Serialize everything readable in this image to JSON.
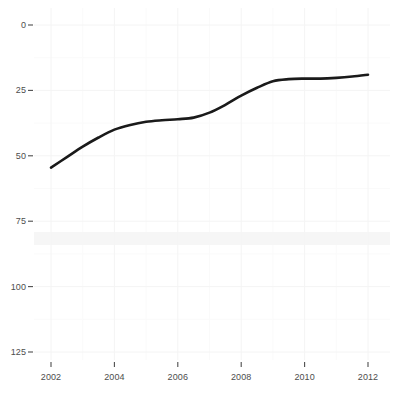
{
  "chart_data": {
    "type": "line",
    "title": "",
    "subtitle": "",
    "xlabel": "",
    "ylabel": "",
    "xlim": [
      2002,
      2012
    ],
    "ylim": [
      0,
      125
    ],
    "grid": true,
    "legend": null,
    "line_color": "#1a1a1a",
    "background_color": "#ffffff",
    "grid_color": "#f2f2f2",
    "x_ticks": [
      "2002",
      "2004",
      "2006",
      "2008",
      "2010",
      "2012"
    ],
    "x_tick_values": [
      2002,
      2004,
      2006,
      2008,
      2010,
      2012
    ],
    "y_ticks": [
      "0",
      "25",
      "50",
      "75",
      "100",
      "125"
    ],
    "y_tick_values": [
      0,
      25,
      50,
      75,
      100,
      125
    ],
    "x": [
      2002,
      2002.5,
      2003,
      2003.5,
      2004,
      2004.5,
      2005,
      2005.5,
      2006,
      2006.5,
      2007,
      2007.5,
      2008,
      2008.5,
      2009,
      2009.5,
      2010,
      2010.5,
      2011,
      2011.5,
      2012
    ],
    "values": [
      70.5,
      74.5,
      78.5,
      82.0,
      85.0,
      86.8,
      88.0,
      88.6,
      89.0,
      89.6,
      91.5,
      94.5,
      98.0,
      101.0,
      103.5,
      104.3,
      104.5,
      104.5,
      104.8,
      105.3,
      106.0
    ],
    "series": [
      {
        "name": "series-1",
        "x": [
          2002,
          2002.5,
          2003,
          2003.5,
          2004,
          2004.5,
          2005,
          2005.5,
          2006,
          2006.5,
          2007,
          2007.5,
          2008,
          2008.5,
          2009,
          2009.5,
          2010,
          2010.5,
          2011,
          2011.5,
          2012
        ],
        "values": [
          70.5,
          74.5,
          78.5,
          82.0,
          85.0,
          86.8,
          88.0,
          88.6,
          89.0,
          89.6,
          91.5,
          94.5,
          98.0,
          101.0,
          103.5,
          104.3,
          104.5,
          104.5,
          104.8,
          105.3,
          106.0
        ]
      }
    ],
    "annotations": []
  },
  "axis": {
    "y_ticks": [
      {
        "label": "125"
      },
      {
        "label": "100"
      },
      {
        "label": "75"
      },
      {
        "label": "50"
      },
      {
        "label": "25"
      },
      {
        "label": "0"
      }
    ],
    "x_ticks": [
      {
        "label": "2002"
      },
      {
        "label": "2004"
      },
      {
        "label": "2006"
      },
      {
        "label": "2008"
      },
      {
        "label": "2010"
      },
      {
        "label": "2012"
      }
    ]
  }
}
